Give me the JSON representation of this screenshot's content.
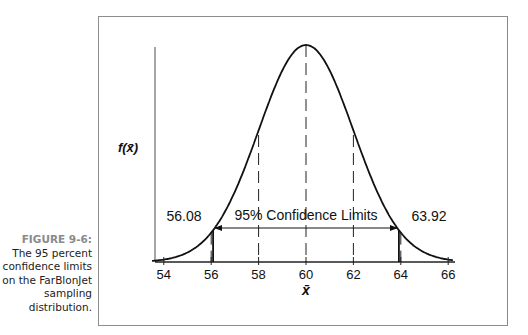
{
  "caption": {
    "figure_label": "FIGURE 9-6:",
    "text": "The 95 percent confidence limits on the FarBlonJet sampling distribution."
  },
  "chart_data": {
    "type": "line",
    "title": "",
    "distribution": "normal",
    "mean": 60,
    "std_error": 2,
    "xlabel": "x̄",
    "ylabel": "f(x̄)",
    "x_ticks": [
      54,
      56,
      58,
      60,
      62,
      64,
      66
    ],
    "xlim": [
      53.5,
      66.2
    ],
    "dashed_lines_at": [
      56,
      58,
      60,
      62,
      64
    ],
    "confidence_limits": {
      "lower": 56.08,
      "upper": 63.92,
      "label": "95% Confidence Limits"
    },
    "grid": false
  },
  "labels": {
    "ylabel": "f(x̄)",
    "xlabel": "x̄",
    "lower_limit": "56.08",
    "upper_limit": "63.92",
    "interval": "95% Confidence Limits",
    "ticks": [
      "54",
      "56",
      "58",
      "60",
      "62",
      "64",
      "66"
    ]
  }
}
